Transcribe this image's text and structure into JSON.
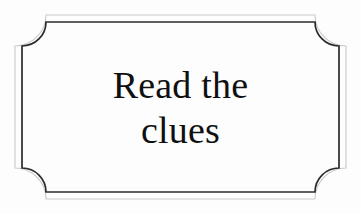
{
  "sign": {
    "type": "decorative-plaque",
    "lines": [
      {
        "text": "Read the"
      },
      {
        "text": "clues"
      }
    ],
    "full_text": "Read the clues",
    "colors": {
      "background": "#fdfdfd",
      "text": "#101010",
      "inner_border": "#2b2b2b",
      "outer_border": "#c9c9c9"
    },
    "frame": {
      "style": "double-line-concave-corners",
      "outer_stroke_width": 1,
      "inner_stroke_width": 1.6,
      "corner_notch_radius": 28
    }
  }
}
